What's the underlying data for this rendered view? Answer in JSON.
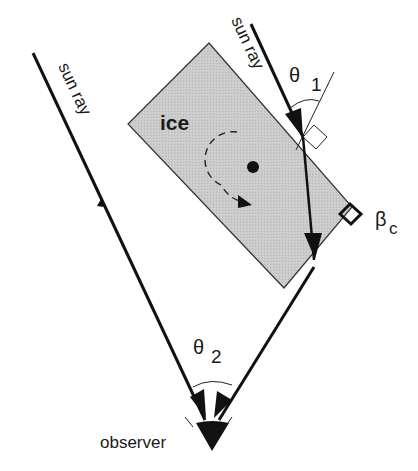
{
  "diagram": {
    "type": "optics-schematic",
    "ice_label": "ice",
    "sun_ray_left_label": "sun ray",
    "sun_ray_right_label": "sun ray",
    "theta1": {
      "symbol": "θ",
      "subscript": "1"
    },
    "theta2": {
      "symbol": "θ",
      "subscript": "2"
    },
    "beta": {
      "symbol": "β",
      "subscript": "c"
    },
    "observer_label": "observer",
    "colors": {
      "ice_fill": "#c8c8c8",
      "line": "#111111",
      "background": "#ffffff"
    }
  }
}
